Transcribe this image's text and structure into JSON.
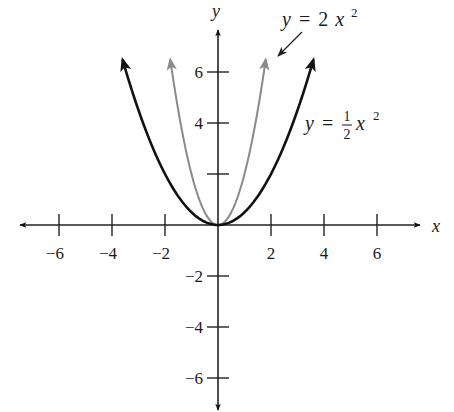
{
  "chart_data": {
    "type": "line",
    "title": "",
    "xlabel": "x",
    "ylabel": "y",
    "xlim": [
      -7.7,
      7.7
    ],
    "ylim": [
      -7.3,
      7.8
    ],
    "grid": false,
    "x_ticks": [
      -6,
      -4,
      -2,
      2,
      4,
      6
    ],
    "y_ticks": [
      -6,
      -4,
      -2,
      2,
      4,
      6
    ],
    "x_tick_labels": [
      "−6",
      "−4",
      "−2",
      "2",
      "4",
      "6"
    ],
    "y_tick_labels": [
      "−6",
      "−4",
      "−2",
      "",
      "4",
      "6"
    ],
    "series": [
      {
        "name": "y = 2x^2",
        "function": "2*x^2",
        "coefficient": 2,
        "x_range": [
          -1.8,
          1.8
        ],
        "color": "#8a8a8a",
        "x": [
          -1.8,
          -1.5,
          -1,
          -0.5,
          0,
          0.5,
          1,
          1.5,
          1.8
        ],
        "values": [
          6.48,
          4.5,
          2,
          0.5,
          0,
          0.5,
          2,
          4.5,
          6.48
        ]
      },
      {
        "name": "y = 1/2 x^2",
        "function": "0.5*x^2",
        "coefficient": 0.5,
        "x_range": [
          -3.6,
          3.6
        ],
        "color": "#111111",
        "x": [
          -3.6,
          -3,
          -2,
          -1,
          0,
          1,
          2,
          3,
          3.6
        ],
        "values": [
          6.48,
          4.5,
          2,
          0.5,
          0,
          0.5,
          2,
          4.5,
          6.48
        ]
      }
    ],
    "annotations": [
      {
        "text": "y = 2x^2",
        "position": "top-right, arrow pointing to gray curve"
      },
      {
        "text": "y = 1/2 x^2",
        "position": "right of black curve"
      }
    ]
  },
  "labels": {
    "x_axis": "x",
    "y_axis": "y",
    "eq1": {
      "lhs": "y",
      "eq": "=",
      "coef": "2",
      "var": "x",
      "exp": "2"
    },
    "eq2": {
      "lhs": "y",
      "eq": "=",
      "num": "1",
      "den": "2",
      "var": "x",
      "exp": "2"
    }
  },
  "layout": {
    "origin_px": [
      218,
      225
    ],
    "px_per_unit_x": 26.5,
    "px_per_unit_y": 25.5
  }
}
